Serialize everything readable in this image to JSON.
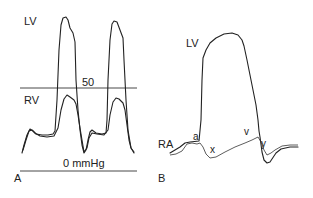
{
  "panel_a": {
    "label": "A",
    "lv_label": "LV",
    "rv_label": "RV",
    "line_50_label": "50",
    "zero_label": "0 mmHg"
  },
  "panel_b": {
    "label": "B",
    "lv_label": "LV",
    "ra_label": "RA",
    "wave_a": "a",
    "wave_x": "x",
    "wave_v": "v",
    "wave_y": "y"
  }
}
